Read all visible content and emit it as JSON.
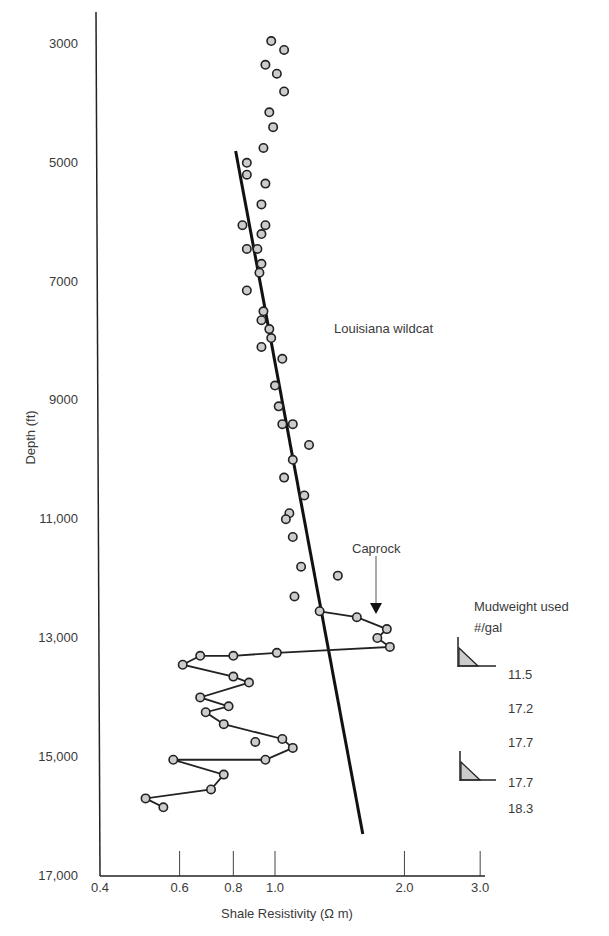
{
  "chart_data": {
    "type": "scatter",
    "title": "",
    "annotation_title": "Louisiana wildcat",
    "xlabel": "Shale Resistivity (Ω m)",
    "ylabel": "Depth (ft)",
    "xscale": "log",
    "xlim": [
      0.4,
      3.0
    ],
    "ylim": [
      17000,
      2500
    ],
    "y_inverted": true,
    "grid": false,
    "x_ticks": [
      "0.4",
      "0.6",
      "0.8",
      "1.0",
      "2.0",
      "3.0"
    ],
    "y_ticks": [
      "3000",
      "5000",
      "7000",
      "9000",
      "11,000",
      "13,000",
      "15,000",
      "17,000"
    ],
    "series": [
      {
        "name": "Normal trend shale points (unconnected)",
        "style": "circle-markers",
        "points": [
          [
            0.98,
            2950
          ],
          [
            1.05,
            3100
          ],
          [
            0.95,
            3350
          ],
          [
            1.01,
            3500
          ],
          [
            1.05,
            3800
          ],
          [
            0.97,
            4150
          ],
          [
            0.99,
            4400
          ],
          [
            0.94,
            4750
          ],
          [
            0.86,
            5000
          ],
          [
            0.86,
            5200
          ],
          [
            0.95,
            5350
          ],
          [
            0.93,
            5700
          ],
          [
            0.95,
            6050
          ],
          [
            0.84,
            6050
          ],
          [
            0.93,
            6200
          ],
          [
            0.86,
            6450
          ],
          [
            0.91,
            6450
          ],
          [
            0.93,
            6700
          ],
          [
            0.92,
            6850
          ],
          [
            0.86,
            7150
          ],
          [
            0.94,
            7500
          ],
          [
            0.93,
            7650
          ],
          [
            0.97,
            7800
          ],
          [
            0.98,
            7950
          ],
          [
            0.93,
            8100
          ],
          [
            1.04,
            8300
          ],
          [
            1.0,
            8750
          ],
          [
            1.02,
            9100
          ],
          [
            1.04,
            9400
          ],
          [
            1.1,
            9400
          ],
          [
            1.2,
            9750
          ],
          [
            1.1,
            10000
          ],
          [
            1.05,
            10300
          ],
          [
            1.17,
            10600
          ],
          [
            1.08,
            10900
          ],
          [
            1.06,
            11000
          ],
          [
            1.1,
            11300
          ],
          [
            1.15,
            11800
          ],
          [
            1.4,
            11950
          ],
          [
            1.11,
            12300
          ]
        ]
      },
      {
        "name": "Overpressured zone shale points (connected)",
        "style": "circle-markers-with-line",
        "points": [
          [
            1.27,
            12550
          ],
          [
            1.55,
            12650
          ],
          [
            1.82,
            12850
          ],
          [
            1.73,
            13000
          ],
          [
            1.85,
            13150
          ],
          [
            1.01,
            13250
          ],
          [
            0.8,
            13300
          ],
          [
            0.67,
            13300
          ],
          [
            0.61,
            13450
          ],
          [
            0.8,
            13650
          ],
          [
            0.87,
            13750
          ],
          [
            0.67,
            14000
          ],
          [
            0.78,
            14150
          ],
          [
            0.69,
            14250
          ],
          [
            0.76,
            14450
          ],
          [
            1.04,
            14700
          ],
          [
            1.1,
            14850
          ],
          [
            0.95,
            15050
          ],
          [
            0.58,
            15050
          ],
          [
            0.76,
            15300
          ],
          [
            0.71,
            15550
          ],
          [
            0.5,
            15700
          ],
          [
            0.55,
            15850
          ]
        ],
        "extra_points": [
          [
            0.9,
            14750
          ]
        ]
      },
      {
        "name": "Normal compaction trend line",
        "style": "line",
        "points": [
          [
            0.81,
            4800
          ],
          [
            1.6,
            16300
          ]
        ]
      }
    ],
    "annotations": [
      {
        "text": "Caprock",
        "arrow_to": [
          1.72,
          12500
        ]
      },
      {
        "text": "Louisiana wildcat",
        "position": [
          1.6,
          7900
        ]
      }
    ],
    "mudweight_table": {
      "header": "Mudweight used",
      "unit": "#/gal",
      "values": [
        "11.5",
        "17.2",
        "17.7",
        "17.7",
        "18.3"
      ],
      "casing_markers_at_depth": [
        13300,
        15300
      ]
    }
  },
  "labels": {
    "xlabel": "Shale Resistivity (Ω m)",
    "ylabel": "Depth (ft)",
    "louisiana": "Louisiana wildcat",
    "caprock": "Caprock",
    "mud_header": "Mudweight used",
    "mud_unit": "#/gal",
    "mud_values": [
      "11.5",
      "17.2",
      "17.7",
      "17.7",
      "18.3"
    ],
    "yticks": [
      "3000",
      "5000",
      "7000",
      "9000",
      "11,000",
      "13,000",
      "15,000",
      "17,000"
    ],
    "xticks": [
      "0.4",
      "0.6",
      "0.8",
      "1.0",
      "2.0",
      "3.0"
    ]
  }
}
